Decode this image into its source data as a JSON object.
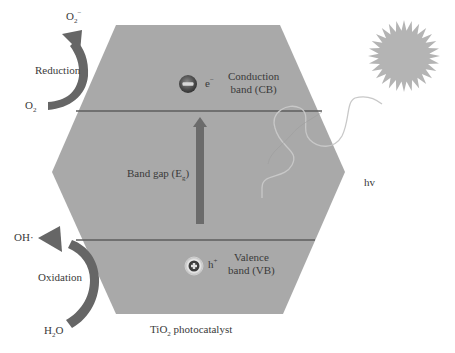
{
  "title": "TiO2 photocatalyst",
  "colors": {
    "hexagon_fill": "#a9a9a9",
    "band_line": "#5e5e5e",
    "arrow": "#6b6b6b",
    "sun": "#b4b4b4",
    "wave": "#c8c8c8",
    "text": "#3a3a3a"
  },
  "reduction": {
    "label": "Reduction",
    "reactant": "O",
    "reactant_sub": "2",
    "product": "O",
    "product_sub": "2",
    "product_sup": "−"
  },
  "oxidation": {
    "label": "Oxidation",
    "reactant_a": "H",
    "reactant_sub": "2",
    "reactant_b": "O",
    "product": "OH·"
  },
  "conduction_band": {
    "line1": "Conduction",
    "line2": "band (CB)",
    "carrier": "e",
    "carrier_sup": "−",
    "icon": "minus-circle-icon"
  },
  "valence_band": {
    "line1": "Valence",
    "line2": "band (VB)",
    "carrier": "h",
    "carrier_sup": "+",
    "icon": "plus-circle-icon"
  },
  "band_gap": {
    "label": "Band gap (E",
    "label_sub": "g",
    "label_close": ")"
  },
  "light": {
    "label": "hv",
    "icon": "sun-icon"
  },
  "caption": {
    "prefix": "TiO",
    "sub": "2",
    "suffix": " photocatalyst"
  }
}
